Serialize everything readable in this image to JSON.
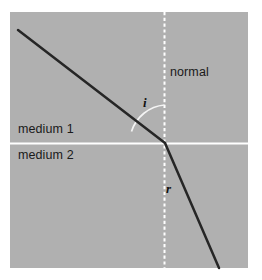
{
  "figure": {
    "panel": {
      "background_color": "#b1b1b1",
      "outer_background_color": "#ffffff",
      "x": 10,
      "y": 12,
      "width": 238,
      "height": 256
    }
  },
  "colors": {
    "ray": "#262626",
    "normal_line": "#ffffff",
    "boundary_line": "#ffffff",
    "arc": "#f2f2f2",
    "text": "#1a1a1a",
    "panel": "#b1b1b1"
  },
  "labels": {
    "normal": "normal",
    "medium_upper": "medium 1",
    "medium_lower": "medium 2",
    "angle_incidence": "i",
    "angle_refraction": "r"
  },
  "geometry": {
    "incidence_point": {
      "x": 165,
      "y": 143
    },
    "incident_ray": {
      "x1": 18,
      "y1": 30,
      "x2": 165,
      "y2": 143
    },
    "refracted_ray": {
      "x1": 165,
      "y1": 143,
      "x2": 219,
      "y2": 268
    },
    "normal_line": {
      "x": 164.5,
      "y1": 12,
      "y2": 268
    },
    "boundary_line": {
      "y": 143,
      "x1": 10,
      "x2": 248
    },
    "angle_of_incidence_degrees": 52,
    "angle_of_refraction_degrees": 23
  },
  "label_positions": {
    "normal": {
      "x": 170,
      "y": 76
    },
    "medium_upper": {
      "x": 18,
      "y": 133
    },
    "medium_lower": {
      "x": 18,
      "y": 159
    },
    "angle_incidence": {
      "x": 143,
      "y": 107
    },
    "angle_refraction": {
      "x": 166,
      "y": 193
    }
  }
}
